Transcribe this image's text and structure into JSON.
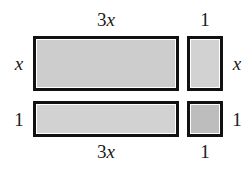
{
  "figure": {
    "kind": "algebra-tile-area-model",
    "background_color": "#ffffff",
    "border_color": "#111111",
    "tiles": [
      {
        "name": "x-squared-times-three-tile",
        "width_label": "3x",
        "height_label": "x",
        "fill_color": "#cdcdcd"
      },
      {
        "name": "x-tile-right",
        "width_label": "1",
        "height_label": "x",
        "fill_color": "#d2d2d2"
      },
      {
        "name": "x-tile-bottom",
        "width_label": "3x",
        "height_label": "1",
        "fill_color": "#d2d2d2"
      },
      {
        "name": "unit-tile",
        "width_label": "1",
        "height_label": "1",
        "fill_color": "#bdbdbd"
      }
    ]
  },
  "labels": {
    "top_left": {
      "prefix": "3",
      "variable": "x"
    },
    "top_right": "1",
    "bottom_left": {
      "prefix": "3",
      "variable": "x"
    },
    "bottom_right": "1",
    "left_upper": "x",
    "left_lower": "1",
    "right_upper": "x",
    "right_lower": "1"
  }
}
